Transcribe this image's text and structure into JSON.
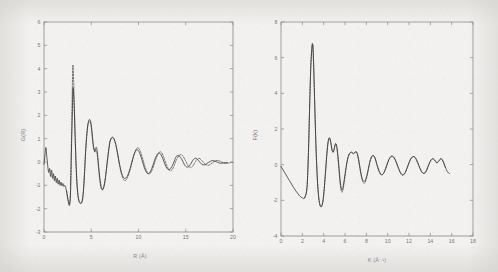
{
  "figure": {
    "background_color": "#f2f1ef",
    "curve_solid_color": "#2b2b2b",
    "curve_dashed_color": "#4a4a4a",
    "axis_color": "#8a8a8a"
  },
  "panels": [
    {
      "name": "left-panel",
      "xlabel_main": "R (A)",
      "xlabel_display": "R (Å)",
      "ylabel_display": "G(R)",
      "xticks": [
        0,
        5,
        10,
        15,
        20
      ],
      "yticks": [
        -3,
        -2,
        -1,
        0,
        1,
        2,
        3,
        4,
        5,
        6
      ]
    },
    {
      "name": "right-panel",
      "xlabel_main": "K (A",
      "xlabel_sup": "-1",
      "xlabel_tail": ")",
      "xlabel_display": "K (Å⁻¹)",
      "ylabel_display": "F(k)",
      "xticks": [
        0,
        2,
        4,
        6,
        8,
        10,
        12,
        14,
        16,
        18
      ],
      "yticks": [
        -4,
        -2,
        0,
        2,
        4,
        6,
        8
      ]
    }
  ],
  "chart_data": [
    {
      "type": "line",
      "title": "",
      "panel": "left",
      "xlabel": "R (Å)",
      "ylabel": "G(R)",
      "xlim": [
        0,
        20
      ],
      "ylim": [
        -3,
        6
      ],
      "grid": false,
      "legend": "none",
      "xticks": [
        0,
        5,
        10,
        15,
        20
      ],
      "yticks": [
        -3,
        -2,
        -1,
        0,
        1,
        2,
        3,
        4,
        5,
        6
      ],
      "series": [
        {
          "name": "experimental (solid)",
          "style": "solid",
          "x": [
            0.0,
            0.1,
            0.2,
            0.3,
            0.4,
            0.5,
            0.6,
            0.7,
            0.8,
            0.9,
            1.0,
            1.1,
            1.2,
            1.3,
            1.4,
            1.5,
            1.6,
            1.7,
            1.8,
            1.9,
            2.0,
            2.1,
            2.2,
            2.3,
            2.4,
            2.5,
            2.6,
            2.7,
            2.8,
            2.9,
            3.0,
            3.05,
            3.1,
            3.2,
            3.3,
            3.4,
            3.5,
            3.6,
            3.7,
            3.8,
            3.9,
            4.0,
            4.1,
            4.2,
            4.3,
            4.4,
            4.5,
            4.6,
            4.7,
            4.8,
            4.9,
            5.0,
            5.1,
            5.2,
            5.3,
            5.4,
            5.5,
            5.6,
            5.7,
            5.8,
            5.9,
            6.0,
            6.1,
            6.2,
            6.3,
            6.4,
            6.5,
            6.6,
            6.7,
            6.8,
            6.9,
            7.0,
            7.2,
            7.4,
            7.6,
            7.8,
            8.0,
            8.2,
            8.4,
            8.6,
            8.8,
            9.0,
            9.2,
            9.4,
            9.6,
            9.8,
            10.0,
            10.2,
            10.4,
            10.6,
            10.8,
            11.0,
            11.2,
            11.4,
            11.6,
            11.8,
            12.0,
            12.2,
            12.4,
            12.6,
            12.8,
            13.0,
            13.2,
            13.4,
            13.6,
            13.8,
            14.0,
            14.3,
            14.6,
            14.9,
            15.2,
            15.5,
            15.8,
            16.1,
            16.4,
            16.7,
            17.0,
            17.4,
            17.8,
            18.2,
            18.6,
            19.0,
            19.4,
            19.8,
            20.0
          ],
          "y": [
            -0.1,
            0.3,
            0.62,
            0.2,
            -0.18,
            -0.45,
            -0.28,
            -0.62,
            -0.35,
            -0.7,
            -0.5,
            -0.8,
            -0.6,
            -0.88,
            -0.7,
            -0.95,
            -0.78,
            -1.0,
            -0.86,
            -1.02,
            -0.92,
            -1.05,
            -1.0,
            -1.1,
            -1.3,
            -1.55,
            -1.75,
            -1.85,
            -1.4,
            0.4,
            2.1,
            3.05,
            3.1,
            2.3,
            1.0,
            -0.2,
            -1.0,
            -1.45,
            -1.68,
            -1.76,
            -1.78,
            -1.74,
            -1.55,
            -1.1,
            -0.4,
            0.4,
            1.0,
            1.45,
            1.72,
            1.82,
            1.78,
            1.6,
            1.2,
            0.8,
            0.55,
            0.45,
            0.62,
            0.55,
            0.2,
            -0.25,
            -0.65,
            -0.95,
            -1.12,
            -1.18,
            -1.12,
            -0.95,
            -0.68,
            -0.35,
            0.0,
            0.35,
            0.65,
            0.9,
            1.05,
            1.0,
            0.75,
            0.35,
            -0.1,
            -0.45,
            -0.66,
            -0.7,
            -0.62,
            -0.42,
            -0.15,
            0.15,
            0.4,
            0.52,
            0.48,
            0.3,
            0.05,
            -0.22,
            -0.42,
            -0.5,
            -0.45,
            -0.28,
            -0.05,
            0.18,
            0.34,
            0.38,
            0.3,
            0.12,
            -0.1,
            -0.26,
            -0.33,
            -0.28,
            -0.14,
            0.05,
            0.24,
            0.26,
            0.1,
            -0.14,
            -0.22,
            -0.1,
            0.1,
            0.16,
            0.04,
            -0.1,
            -0.12,
            -0.02,
            0.06,
            0.02,
            -0.05,
            -0.04,
            -0.02,
            -0.03
          ]
        },
        {
          "name": "theoretical fit (dashed)",
          "style": "dashed",
          "x": [
            2.4,
            2.5,
            2.6,
            2.7,
            2.8,
            2.9,
            3.0,
            3.05,
            3.1,
            3.2,
            3.3,
            3.4,
            3.5,
            3.6,
            3.7,
            3.8,
            3.9,
            4.0,
            4.1,
            4.2,
            4.3,
            4.4,
            4.5,
            4.6,
            4.7,
            4.8,
            4.9,
            5.0,
            5.1,
            5.2,
            5.3,
            5.4,
            5.5,
            5.6,
            5.7,
            5.8,
            5.9,
            6.0,
            6.1,
            6.2,
            6.3,
            6.4,
            6.5,
            6.6,
            6.7,
            6.8,
            6.9,
            7.0,
            7.2,
            7.4,
            7.6,
            7.8,
            8.0,
            8.2,
            8.4,
            8.6,
            8.8,
            9.0,
            9.2,
            9.4,
            9.6,
            9.8,
            10.0,
            10.2,
            10.4,
            10.6,
            10.8,
            11.0,
            11.2,
            11.4,
            11.6,
            11.8,
            12.0,
            12.2,
            12.4,
            12.6,
            12.8,
            13.0,
            13.2,
            13.4,
            13.6,
            13.8,
            14.0,
            14.3,
            14.6,
            14.9,
            15.2,
            15.5,
            15.8,
            16.1,
            16.4,
            16.7,
            17.0,
            17.4,
            17.8,
            18.2,
            18.6,
            19.0,
            19.4,
            19.8,
            20.0
          ],
          "y": [
            -1.25,
            -1.5,
            -1.7,
            -1.8,
            -1.3,
            0.8,
            3.2,
            4.1,
            3.9,
            2.6,
            1.1,
            -0.1,
            -0.95,
            -1.42,
            -1.65,
            -1.74,
            -1.76,
            -1.7,
            -1.5,
            -1.05,
            -0.35,
            0.45,
            1.05,
            1.48,
            1.7,
            1.76,
            1.7,
            1.5,
            1.1,
            0.72,
            0.5,
            0.42,
            0.5,
            0.4,
            0.05,
            -0.4,
            -0.78,
            -1.05,
            -1.18,
            -1.2,
            -1.1,
            -0.92,
            -0.66,
            -0.32,
            0.04,
            0.4,
            0.7,
            0.92,
            1.06,
            0.98,
            0.72,
            0.3,
            -0.16,
            -0.52,
            -0.74,
            -0.8,
            -0.7,
            -0.48,
            -0.2,
            0.14,
            0.4,
            0.58,
            0.6,
            0.45,
            0.2,
            -0.08,
            -0.32,
            -0.48,
            -0.5,
            -0.38,
            -0.16,
            0.08,
            0.28,
            0.42,
            0.42,
            0.28,
            0.06,
            -0.16,
            -0.32,
            -0.38,
            -0.3,
            -0.12,
            0.08,
            0.28,
            0.3,
            0.12,
            -0.12,
            -0.24,
            -0.14,
            0.06,
            0.16,
            0.06,
            -0.08,
            -0.14,
            -0.04,
            0.06,
            0.04,
            -0.04,
            -0.06,
            -0.02,
            -0.02
          ]
        }
      ]
    },
    {
      "type": "line",
      "title": "",
      "panel": "right",
      "xlabel": "K (Å⁻¹)",
      "ylabel": "F(k)",
      "xlim": [
        0,
        18
      ],
      "ylim": [
        -4,
        8
      ],
      "grid": false,
      "legend": "none",
      "xticks": [
        0,
        2,
        4,
        6,
        8,
        10,
        12,
        14,
        16,
        18
      ],
      "yticks": [
        -4,
        -2,
        0,
        2,
        4,
        6,
        8
      ],
      "series": [
        {
          "name": "experimental (solid)",
          "style": "solid",
          "x": [
            0.0,
            0.2,
            0.4,
            0.6,
            0.8,
            1.0,
            1.2,
            1.4,
            1.6,
            1.8,
            2.0,
            2.2,
            2.4,
            2.5,
            2.6,
            2.7,
            2.8,
            2.9,
            2.95,
            3.0,
            3.05,
            3.1,
            3.2,
            3.3,
            3.4,
            3.5,
            3.6,
            3.7,
            3.8,
            3.9,
            4.0,
            4.1,
            4.2,
            4.3,
            4.4,
            4.5,
            4.6,
            4.7,
            4.8,
            4.9,
            5.0,
            5.1,
            5.2,
            5.3,
            5.4,
            5.5,
            5.6,
            5.7,
            5.8,
            5.9,
            6.0,
            6.1,
            6.2,
            6.3,
            6.4,
            6.5,
            6.6,
            6.7,
            6.8,
            6.9,
            7.0,
            7.1,
            7.2,
            7.3,
            7.4,
            7.5,
            7.6,
            7.7,
            7.8,
            7.9,
            8.0,
            8.1,
            8.2,
            8.3,
            8.4,
            8.5,
            8.6,
            8.7,
            8.8,
            8.9,
            9.0,
            9.2,
            9.4,
            9.6,
            9.8,
            10.0,
            10.2,
            10.4,
            10.6,
            10.8,
            11.0,
            11.2,
            11.4,
            11.6,
            11.8,
            12.0,
            12.2,
            12.4,
            12.6,
            12.8,
            13.0,
            13.2,
            13.4,
            13.6,
            13.8,
            14.0,
            14.2,
            14.4,
            14.6,
            14.8,
            15.0,
            15.2,
            15.4,
            15.6,
            15.8
          ],
          "y": [
            -0.1,
            -0.3,
            -0.5,
            -0.7,
            -0.9,
            -1.1,
            -1.3,
            -1.48,
            -1.64,
            -1.78,
            -1.86,
            -1.88,
            -1.5,
            -0.6,
            1.2,
            3.6,
            5.6,
            6.6,
            6.8,
            6.6,
            5.8,
            4.8,
            2.6,
            0.7,
            -0.7,
            -1.6,
            -2.1,
            -2.32,
            -2.34,
            -2.15,
            -1.7,
            -1.0,
            -0.2,
            0.6,
            1.2,
            1.5,
            1.45,
            1.15,
            0.8,
            0.7,
            0.9,
            1.15,
            1.1,
            0.7,
            0.1,
            -0.6,
            -1.15,
            -1.4,
            -1.3,
            -0.95,
            -0.55,
            -0.15,
            0.2,
            0.45,
            0.6,
            0.68,
            0.7,
            0.66,
            0.62,
            0.66,
            0.72,
            0.68,
            0.5,
            0.2,
            -0.15,
            -0.5,
            -0.75,
            -0.9,
            -0.94,
            -0.88,
            -0.72,
            -0.48,
            -0.2,
            0.08,
            0.3,
            0.45,
            0.52,
            0.5,
            0.4,
            0.22,
            0.0,
            -0.35,
            -0.55,
            -0.5,
            -0.25,
            0.1,
            0.38,
            0.48,
            0.4,
            0.16,
            -0.16,
            -0.44,
            -0.56,
            -0.48,
            -0.22,
            0.1,
            0.35,
            0.45,
            0.38,
            0.14,
            -0.16,
            -0.4,
            -0.48,
            -0.36,
            -0.08,
            0.2,
            0.34,
            0.26,
            0.1,
            0.2,
            0.34,
            0.2,
            -0.12,
            -0.4,
            -0.5
          ]
        },
        {
          "name": "theoretical fit (dashed)",
          "style": "dashed",
          "x": [
            2.2,
            2.4,
            2.5,
            2.6,
            2.7,
            2.8,
            2.9,
            2.95,
            3.0,
            3.05,
            3.1,
            3.2,
            3.3,
            3.4,
            3.5,
            3.6,
            3.7,
            3.8,
            3.9,
            4.0,
            4.1,
            4.2,
            4.3,
            4.4,
            4.5,
            4.6,
            4.7,
            4.8,
            4.9,
            5.0,
            5.1,
            5.2,
            5.3,
            5.4,
            5.5,
            5.6,
            5.7,
            5.8,
            5.9,
            6.0,
            6.1,
            6.2,
            6.3,
            6.4,
            6.5,
            6.6,
            6.7,
            6.8,
            6.9,
            7.0,
            7.1,
            7.2,
            7.3,
            7.4,
            7.5,
            7.6,
            7.7,
            7.8,
            7.9,
            8.0,
            8.1,
            8.2,
            8.3,
            8.4,
            8.5,
            8.6,
            8.7,
            8.8,
            8.9,
            9.0,
            9.2,
            9.4,
            9.6,
            9.8,
            10.0,
            10.2,
            10.4,
            10.6,
            10.8,
            11.0,
            11.2,
            11.4,
            11.6,
            11.8,
            12.0,
            12.2,
            12.4,
            12.6,
            12.8,
            13.0,
            13.2,
            13.4,
            13.6,
            13.8,
            14.0,
            14.2,
            14.4,
            14.6,
            14.8,
            15.0,
            15.2,
            15.4,
            15.6,
            15.8
          ],
          "y": [
            -1.86,
            -1.46,
            -0.55,
            1.25,
            3.62,
            5.58,
            6.55,
            6.72,
            6.5,
            5.7,
            4.7,
            2.55,
            0.65,
            -0.75,
            -1.65,
            -2.14,
            -2.34,
            -2.36,
            -2.16,
            -1.72,
            -1.02,
            -0.22,
            0.58,
            1.2,
            1.46,
            1.4,
            1.1,
            0.78,
            0.72,
            0.95,
            1.18,
            1.08,
            0.62,
            -0.05,
            -0.8,
            -1.32,
            -1.55,
            -1.45,
            -1.1,
            -0.66,
            -0.22,
            0.15,
            0.42,
            0.58,
            0.66,
            0.7,
            0.66,
            0.62,
            0.66,
            0.74,
            0.7,
            0.5,
            0.18,
            -0.2,
            -0.56,
            -0.84,
            -1.0,
            -1.05,
            -0.98,
            -0.8,
            -0.54,
            -0.24,
            0.06,
            0.28,
            0.44,
            0.5,
            0.48,
            0.38,
            0.2,
            -0.04,
            -0.4,
            -0.58,
            -0.5,
            -0.22,
            0.12,
            0.38,
            0.48,
            0.38,
            0.12,
            -0.2,
            -0.48,
            -0.6,
            -0.5,
            -0.22,
            0.12,
            0.36,
            0.46,
            0.38,
            0.12,
            -0.18,
            -0.42,
            -0.5,
            -0.38,
            -0.1,
            0.18,
            0.32,
            0.26,
            0.12,
            0.22,
            0.34,
            0.16,
            -0.16,
            -0.42
          ]
        }
      ]
    }
  ]
}
